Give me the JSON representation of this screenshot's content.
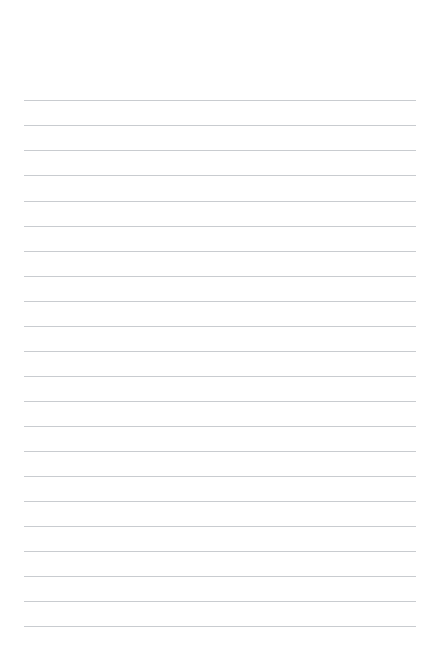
{
  "page": {
    "kind": "lined-paper-sheet",
    "width_px": 439,
    "height_px": 666,
    "background_color": "#ffffff",
    "is_blank": true,
    "visible_text": ""
  },
  "paper": {
    "rule_color": "#c9ccd0",
    "rule_thickness_px": 1,
    "rule_count": 22,
    "rule_spacing_px": 25.05,
    "first_rule_y_px": 100,
    "last_rule_y_px": 626,
    "rule_left_x_px": 24,
    "rule_right_x_px": 416,
    "rule_width_px": 392,
    "top_margin_px": 100,
    "bottom_margin_px": 40,
    "has_vertical_margin_line": false,
    "has_holes": false
  },
  "lines": [
    {
      "index": 1,
      "y": 100,
      "text": ""
    },
    {
      "index": 2,
      "y": 125,
      "text": ""
    },
    {
      "index": 3,
      "y": 150,
      "text": ""
    },
    {
      "index": 4,
      "y": 175,
      "text": ""
    },
    {
      "index": 5,
      "y": 201,
      "text": ""
    },
    {
      "index": 6,
      "y": 226,
      "text": ""
    },
    {
      "index": 7,
      "y": 251,
      "text": ""
    },
    {
      "index": 8,
      "y": 276,
      "text": ""
    },
    {
      "index": 9,
      "y": 301,
      "text": ""
    },
    {
      "index": 10,
      "y": 326,
      "text": ""
    },
    {
      "index": 11,
      "y": 351,
      "text": ""
    },
    {
      "index": 12,
      "y": 376,
      "text": ""
    },
    {
      "index": 13,
      "y": 401,
      "text": ""
    },
    {
      "index": 14,
      "y": 426,
      "text": ""
    },
    {
      "index": 15,
      "y": 451,
      "text": ""
    },
    {
      "index": 16,
      "y": 476,
      "text": ""
    },
    {
      "index": 17,
      "y": 501,
      "text": ""
    },
    {
      "index": 18,
      "y": 526,
      "text": ""
    },
    {
      "index": 19,
      "y": 551,
      "text": ""
    },
    {
      "index": 20,
      "y": 576,
      "text": ""
    },
    {
      "index": 21,
      "y": 601,
      "text": ""
    },
    {
      "index": 22,
      "y": 626,
      "text": ""
    }
  ]
}
